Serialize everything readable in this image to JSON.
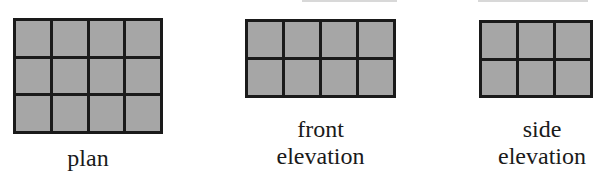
{
  "views": [
    {
      "id": "plan",
      "label": "plan",
      "rows": 3,
      "cols": 4
    },
    {
      "id": "front",
      "label": "front\nelevation",
      "rows": 2,
      "cols": 4
    },
    {
      "id": "side",
      "label": "side\nelevation",
      "rows": 2,
      "cols": 3
    }
  ],
  "colors": {
    "cell_fill": "#a6a6a6",
    "grid_line": "#1a1a1a"
  }
}
